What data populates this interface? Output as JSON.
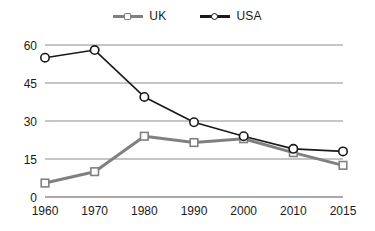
{
  "chart_data": {
    "type": "line",
    "title": "",
    "subtitle": "",
    "xlabel": "",
    "ylabel": "",
    "categories": [
      "1960",
      "1970",
      "1980",
      "1990",
      "2000",
      "2010",
      "2015"
    ],
    "x_tick_labels": [
      "1960",
      "1970",
      "1980",
      "1990",
      "2000",
      "2010",
      "2015"
    ],
    "y_tick_labels": [
      "0",
      "15",
      "30",
      "45",
      "60"
    ],
    "y_ticks": [
      0,
      15,
      30,
      45,
      60
    ],
    "ylim": [
      0,
      60
    ],
    "grid": "horizontal",
    "legend_position": "top-center",
    "series": [
      {
        "name": "UK",
        "color": "#808080",
        "marker": "square",
        "values": [
          5.5,
          10,
          24,
          21.5,
          23,
          17.5,
          12.5
        ]
      },
      {
        "name": "USA",
        "color": "#1a1a1a",
        "marker": "circle",
        "values": [
          55,
          58,
          39.5,
          29.5,
          24,
          19,
          18
        ]
      }
    ]
  },
  "legend": {
    "entries": [
      {
        "label": "UK"
      },
      {
        "label": "USA"
      }
    ]
  },
  "colors": {
    "uk_line": "#808080",
    "usa_line": "#1a1a1a",
    "gridline": "#8c8c8c",
    "axis_text": "#1a1a1a",
    "background": "#ffffff"
  }
}
